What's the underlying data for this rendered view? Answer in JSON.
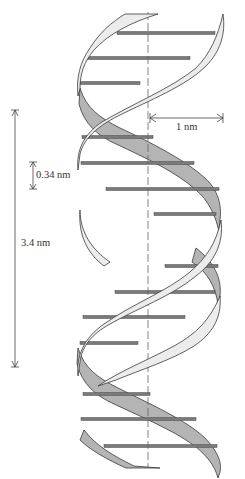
{
  "diagram": {
    "labels": {
      "width": "1 nm",
      "rise": "0.34 nm",
      "pitch": "3.4 nm"
    },
    "colors": {
      "front_strand": "#ececec",
      "back_strand": "#b4b4b4",
      "strand_outline": "#3a3a3a",
      "base_pair": "#7a7a7a",
      "base_pair_outline": "#4a4a4a",
      "axis": "#666666",
      "dimension": "#444444"
    },
    "axis": {
      "x": 148,
      "y1": 12,
      "y2": 468
    },
    "base_pairs": [
      {
        "y": 33,
        "x1": 117,
        "x2": 215
      },
      {
        "y": 58,
        "x1": 87,
        "x2": 190
      },
      {
        "y": 83,
        "x1": 80,
        "x2": 140
      },
      {
        "y": 137,
        "x1": 82,
        "x2": 153
      },
      {
        "y": 163,
        "x1": 81,
        "x2": 194
      },
      {
        "y": 189,
        "x1": 106,
        "x2": 219
      },
      {
        "y": 214,
        "x1": 154,
        "x2": 216
      },
      {
        "y": 266,
        "x1": 165,
        "x2": 218
      },
      {
        "y": 292,
        "x1": 115,
        "x2": 215
      },
      {
        "y": 317,
        "x1": 83,
        "x2": 185
      },
      {
        "y": 343,
        "x1": 80,
        "x2": 138
      },
      {
        "y": 394,
        "x1": 83,
        "x2": 150
      },
      {
        "y": 419,
        "x1": 81,
        "x2": 196
      },
      {
        "y": 446,
        "x1": 104,
        "x2": 217
      }
    ],
    "dimensions": {
      "width_arrow": {
        "x1": 150,
        "x2": 223,
        "y": 118
      },
      "rise_arrow": {
        "x": 33,
        "y1": 162,
        "y2": 189
      },
      "pitch_arrow": {
        "x": 15,
        "y1": 110,
        "y2": 367
      }
    }
  }
}
